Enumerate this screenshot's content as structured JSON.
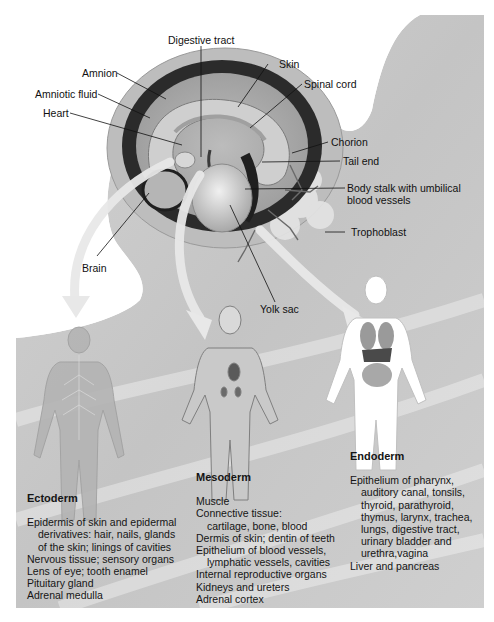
{
  "figure": {
    "colors": {
      "background_gray": "#c9c9c9",
      "page_white": "#ffffff",
      "amnion_dark": "#2b2b2b",
      "chorion_light": "#bdbdbd",
      "arrow_light": "#e6e6e6",
      "label_text": "#111111"
    },
    "embryo_labels": {
      "digestive_tract": "Digestive tract",
      "amnion": "Amnion",
      "skin": "Skin",
      "amniotic_fluid": "Amniotic fluid",
      "spinal_cord": "Spinal cord",
      "heart": "Heart",
      "chorion": "Chorion",
      "tail_end": "Tail end",
      "body_stalk_line1": "Body stalk with umbilical",
      "body_stalk_line2": "blood vessels",
      "trophoblast": "Trophoblast",
      "brain": "Brain",
      "yolk_sac": "Yolk sac"
    },
    "germ_layers": [
      {
        "title": "Ectoderm",
        "items": [
          {
            "text": "Epidermis of skin and epidermal",
            "indent": false
          },
          {
            "text": "derivatives: hair, nails, glands",
            "indent": true
          },
          {
            "text": "of the skin; linings of cavities",
            "indent": true
          },
          {
            "text": "Nervous tissue; sensory organs",
            "indent": false
          },
          {
            "text": "Lens of eye; tooth enamel",
            "indent": false
          },
          {
            "text": "Pituitary gland",
            "indent": false
          },
          {
            "text": "Adrenal medulla",
            "indent": false
          }
        ]
      },
      {
        "title": "Mesoderm",
        "items": [
          {
            "text": "Muscle",
            "indent": false
          },
          {
            "text": "Connective tissue:",
            "indent": false
          },
          {
            "text": "cartilage, bone, blood",
            "indent": true
          },
          {
            "text": "Dermis of skin; dentin of teeth",
            "indent": false
          },
          {
            "text": "Epithelium of blood vessels,",
            "indent": false
          },
          {
            "text": "lymphatic vessels, cavities",
            "indent": true
          },
          {
            "text": "Internal reproductive organs",
            "indent": false
          },
          {
            "text": "Kidneys and ureters",
            "indent": false
          },
          {
            "text": "Adrenal cortex",
            "indent": false
          }
        ]
      },
      {
        "title": "Endoderm",
        "items": [
          {
            "text": "Epithelium of pharynx,",
            "indent": false
          },
          {
            "text": "auditory canal, tonsils,",
            "indent": true
          },
          {
            "text": "thyroid, parathyroid,",
            "indent": true
          },
          {
            "text": "thymus, larynx, trachea,",
            "indent": true
          },
          {
            "text": "lungs, digestive tract,",
            "indent": true
          },
          {
            "text": "urinary bladder and",
            "indent": true
          },
          {
            "text": "urethra,vagina",
            "indent": true
          },
          {
            "text": "Liver and pancreas",
            "indent": false
          }
        ]
      }
    ]
  }
}
